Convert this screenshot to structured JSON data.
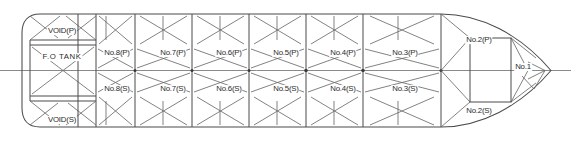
{
  "drawing": {
    "type": "ship-tank-arrangement-plan",
    "view": "plan-view",
    "width": 571,
    "height": 142,
    "stroke_color": "#4a4a4a",
    "centerline_color": "#8a8a8a",
    "text_color": "#2b2b2b"
  },
  "tanks": {
    "stern": [
      {
        "id": "void-p",
        "label": "VOID(P)",
        "x": 62,
        "y": 31
      },
      {
        "id": "fo-tank",
        "label": "F.O TANK",
        "x": 62,
        "y": 57,
        "wide": true
      },
      {
        "id": "void-s",
        "label": "VOID(S)",
        "x": 62,
        "y": 120
      }
    ],
    "port": [
      {
        "id": "no8-p",
        "label": "No.8(P)",
        "x": 117,
        "y": 53
      },
      {
        "id": "no7-p",
        "label": "No.7(P)",
        "x": 173,
        "y": 53
      },
      {
        "id": "no6-p",
        "label": "No.6(P)",
        "x": 229,
        "y": 53
      },
      {
        "id": "no5-p",
        "label": "No.5(P)",
        "x": 286,
        "y": 53
      },
      {
        "id": "no4-p",
        "label": "No.4(P)",
        "x": 343,
        "y": 53
      },
      {
        "id": "no3-p",
        "label": "No.3(P)",
        "x": 405,
        "y": 53
      },
      {
        "id": "no2-p",
        "label": "No.2(P)",
        "x": 479,
        "y": 40
      }
    ],
    "starboard": [
      {
        "id": "no8-s",
        "label": "No.8(S)",
        "x": 117,
        "y": 89
      },
      {
        "id": "no7-s",
        "label": "No.7(S)",
        "x": 173,
        "y": 89
      },
      {
        "id": "no6-s",
        "label": "No.6(S)",
        "x": 229,
        "y": 89
      },
      {
        "id": "no5-s",
        "label": "No.5(S)",
        "x": 286,
        "y": 89
      },
      {
        "id": "no4-s",
        "label": "No.4(S)",
        "x": 343,
        "y": 89
      },
      {
        "id": "no3-s",
        "label": "No.3(S)",
        "x": 405,
        "y": 89
      },
      {
        "id": "no2-s",
        "label": "No.2(S)",
        "x": 479,
        "y": 111
      }
    ],
    "bow": [
      {
        "id": "no1",
        "label": "No.1",
        "x": 523,
        "y": 67
      }
    ]
  },
  "geometry": {
    "hull_top": 14,
    "hull_bottom": 127,
    "centerline_y": 70.5,
    "stern_left": 22,
    "parallel_start": 78,
    "parallel_end": 441,
    "bow_tip_x": 551,
    "centerline_x_start": 0,
    "centerline_x_end": 571,
    "bulkheads_x": [
      78,
      135,
      192,
      249,
      306,
      363,
      441
    ],
    "stern_divider_x": 96,
    "stern_deck_y": [
      40,
      45,
      96,
      101
    ],
    "frame_box": {
      "x": 470,
      "y": 38,
      "w": 41,
      "h": 64
    }
  }
}
